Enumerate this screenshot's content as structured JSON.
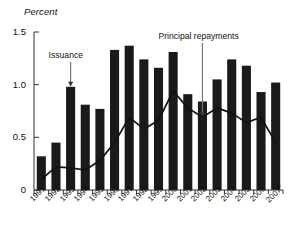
{
  "chart_data": {
    "type": "bar",
    "title": "",
    "subtitle": "",
    "ylabel": "Percent",
    "xlabel": "",
    "ylim": [
      0,
      1.5
    ],
    "yticks": [
      0,
      0.5,
      1.0,
      1.5
    ],
    "ytick_labels": [
      "0",
      "0.5",
      "1.0",
      "1.5"
    ],
    "grid": false,
    "legend_position": "none",
    "categories": [
      "1991",
      "1992",
      "1993",
      "1994",
      "1995",
      "1996",
      "1997",
      "1998",
      "1999",
      "2000",
      "2001",
      "2002",
      "2003",
      "2004",
      "2005",
      "2006",
      "2007e"
    ],
    "series": [
      {
        "name": "Issuance",
        "type": "bar",
        "color": "#1a1a1a",
        "values": [
          0.32,
          0.45,
          0.98,
          0.81,
          0.77,
          1.33,
          1.37,
          1.24,
          1.16,
          1.31,
          0.91,
          0.84,
          1.05,
          1.24,
          1.18,
          0.93,
          1.02
        ]
      },
      {
        "name": "Principal repayments",
        "type": "line",
        "color": "#111111",
        "values": [
          0.1,
          0.22,
          0.21,
          0.19,
          0.28,
          0.45,
          0.69,
          0.58,
          0.66,
          0.94,
          0.78,
          0.69,
          0.78,
          0.73,
          0.64,
          0.69,
          0.45
        ]
      }
    ],
    "annotations": [
      {
        "label": "Issuance",
        "target_category": "1993",
        "target_value": 0.98,
        "arrow": "down"
      },
      {
        "label": "Principal repayments",
        "target_category": "2002",
        "target_value": 0.69,
        "arrow": "down"
      }
    ]
  }
}
